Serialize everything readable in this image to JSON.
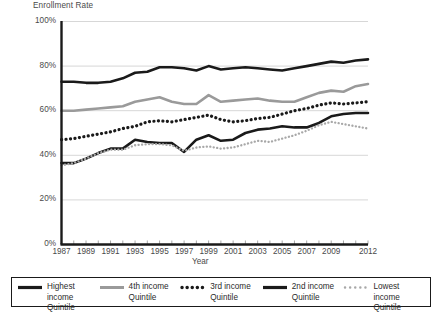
{
  "chart_data": {
    "type": "line",
    "title": "",
    "ylabel": "Enrollment Rate",
    "xlabel": "Year",
    "grid": true,
    "legend_position": "bottom",
    "ylim": [
      0,
      100
    ],
    "ytick_labels": [
      "0%",
      "20%",
      "40%",
      "60%",
      "80%",
      "100%"
    ],
    "ytick_values": [
      0,
      20,
      40,
      60,
      80,
      100
    ],
    "xlim": [
      1987,
      2012
    ],
    "xtick_labels": [
      "1987",
      "1989",
      "1991",
      "1993",
      "1995",
      "1997",
      "1999",
      "2001",
      "2003",
      "2005",
      "2007",
      "2009",
      "2012"
    ],
    "xtick_values": [
      1987,
      1989,
      1991,
      1993,
      1995,
      1997,
      1999,
      2001,
      2003,
      2005,
      2007,
      2009,
      2012
    ],
    "x": [
      1987,
      1988,
      1989,
      1990,
      1991,
      1992,
      1993,
      1994,
      1995,
      1996,
      1997,
      1998,
      1999,
      2000,
      2001,
      2002,
      2003,
      2004,
      2005,
      2006,
      2007,
      2008,
      2009,
      2010,
      2011,
      2012
    ],
    "series": [
      {
        "name": "Highest income Quintile",
        "color": "#1a1a1a",
        "style": "solid",
        "width": 2.6,
        "values": [
          73,
          73,
          72.5,
          72.5,
          73,
          74.5,
          77,
          77.5,
          79.5,
          79.5,
          79,
          78,
          80,
          78.5,
          79,
          79.5,
          79,
          78.5,
          78,
          79,
          80,
          81,
          82,
          81.5,
          82.5,
          83
        ]
      },
      {
        "name": "4th income Quintile",
        "color": "#9a9a9a",
        "style": "solid",
        "width": 2.6,
        "values": [
          60,
          60,
          60.5,
          61,
          61.5,
          62,
          64,
          65,
          66,
          64,
          63,
          63,
          67,
          64,
          64.5,
          65,
          65.5,
          64.5,
          64,
          64,
          66,
          68,
          69,
          68.5,
          71,
          72
        ]
      },
      {
        "name": "3rd income Quintile",
        "color": "#1a1a1a",
        "style": "dotted-thick",
        "width": 3.0,
        "values": [
          47,
          47.5,
          48.5,
          49.5,
          50.5,
          52,
          53,
          55,
          55.5,
          55,
          56,
          57,
          58,
          56,
          55,
          55.5,
          56.5,
          57,
          58.5,
          60,
          61,
          62.5,
          63.5,
          63,
          63.5,
          64
        ]
      },
      {
        "name": "2nd income Quintile",
        "color": "#1a1a1a",
        "style": "solid",
        "width": 2.6,
        "values": [
          36.5,
          36.5,
          38.5,
          41,
          43,
          43,
          47,
          46,
          45.5,
          45.5,
          41.5,
          47,
          49,
          46.5,
          47,
          50,
          51.5,
          52,
          53,
          52.5,
          52.5,
          54.5,
          57.5,
          58.5,
          59,
          59
        ]
      },
      {
        "name": "Lowest income Quintile",
        "color": "#a8a8a8",
        "style": "dotted-thin",
        "width": 2.4,
        "values": [
          35.5,
          36.5,
          38.5,
          41,
          42.5,
          42.5,
          44.5,
          45,
          45,
          44.5,
          42,
          43.5,
          44,
          43,
          43.5,
          45,
          46.5,
          46,
          47.5,
          49,
          51,
          53.5,
          55,
          54,
          53,
          52
        ]
      }
    ]
  },
  "legend": {
    "items": [
      {
        "label": "Highest income\nQuintile",
        "swatch": "solid-black-line-icon"
      },
      {
        "label": "4th income\nQuintile",
        "swatch": "solid-gray-line-icon"
      },
      {
        "label": "3rd income\nQuintile",
        "swatch": "dotted-black-line-icon"
      },
      {
        "label": "2nd income\nQuintile",
        "swatch": "solid-black-line-icon"
      },
      {
        "label": "Lowest income\nQuintile",
        "swatch": "dotted-gray-line-icon"
      }
    ]
  }
}
